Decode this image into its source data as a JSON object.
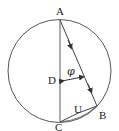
{
  "diagram": {
    "type": "geometry",
    "points": {
      "A": {
        "label": "A",
        "x": 60,
        "y": 20
      },
      "B": {
        "label": "B",
        "x": 97,
        "y": 106
      },
      "C": {
        "label": "C",
        "x": 60,
        "y": 122
      },
      "D": {
        "label": "D",
        "x": 60,
        "y": 81
      }
    },
    "segments": [
      {
        "from": "A",
        "to": "C",
        "name": "diameter-AC"
      },
      {
        "from": "A",
        "to": "B",
        "name": "chord-AB",
        "arrows": 2
      },
      {
        "from": "C",
        "to": "B",
        "name": "chord-CB",
        "label": "U"
      }
    ],
    "angle_label": "φ",
    "chord_label": "U",
    "circle": {
      "cx": 59.5,
      "cy": 71,
      "r": 52
    },
    "stroke_color": "#555555"
  }
}
